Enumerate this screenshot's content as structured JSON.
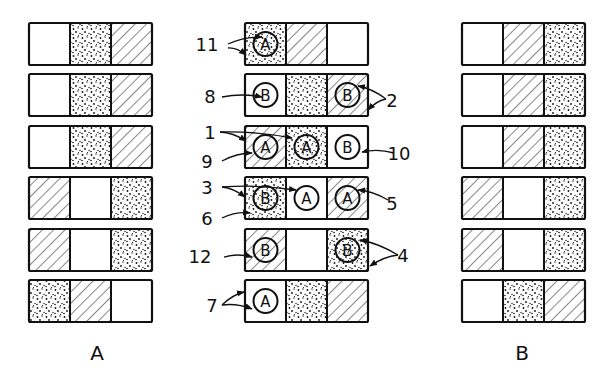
{
  "figure": {
    "column_labels": {
      "left": "A",
      "right": "B"
    },
    "legend_patterns": [
      "blank",
      "dotted",
      "hatched"
    ],
    "colors": {
      "ink": "#111111",
      "background": "#ffffff"
    }
  },
  "column_a": {
    "label": "A",
    "rows": [
      [
        "blank",
        "dotted",
        "hatched"
      ],
      [
        "blank",
        "dotted",
        "hatched"
      ],
      [
        "blank",
        "dotted",
        "hatched"
      ],
      [
        "hatched",
        "blank",
        "dotted"
      ],
      [
        "hatched",
        "blank",
        "dotted"
      ],
      [
        "dotted",
        "hatched",
        "blank"
      ]
    ]
  },
  "column_center": {
    "rows": [
      {
        "cells": [
          "dotted",
          "hatched",
          "blank"
        ],
        "circles": [
          {
            "cell": 0,
            "letter": "A"
          }
        ],
        "callouts": [
          {
            "num": "11",
            "side": "left"
          }
        ]
      },
      {
        "cells": [
          "blank",
          "dotted",
          "hatched"
        ],
        "circles": [
          {
            "cell": 0,
            "letter": "B"
          },
          {
            "cell": 2,
            "letter": "B"
          }
        ],
        "callouts": [
          {
            "num": "8",
            "side": "left"
          },
          {
            "num": "2",
            "side": "right"
          }
        ]
      },
      {
        "cells": [
          "hatched",
          "dotted",
          "blank"
        ],
        "circles": [
          {
            "cell": 0,
            "letter": "A"
          },
          {
            "cell": 1,
            "letter": "A"
          },
          {
            "cell": 2,
            "letter": "B"
          }
        ],
        "callouts": [
          {
            "num": "1",
            "side": "left"
          },
          {
            "num": "9",
            "side": "left"
          },
          {
            "num": "10",
            "side": "right"
          }
        ]
      },
      {
        "cells": [
          "dotted",
          "blank",
          "hatched"
        ],
        "circles": [
          {
            "cell": 0,
            "letter": "B"
          },
          {
            "cell": 1,
            "letter": "A"
          },
          {
            "cell": 2,
            "letter": "A"
          }
        ],
        "callouts": [
          {
            "num": "3",
            "side": "left"
          },
          {
            "num": "6",
            "side": "left"
          },
          {
            "num": "5",
            "side": "right"
          }
        ]
      },
      {
        "cells": [
          "hatched",
          "blank",
          "dotted"
        ],
        "circles": [
          {
            "cell": 0,
            "letter": "B"
          },
          {
            "cell": 2,
            "letter": "B"
          }
        ],
        "callouts": [
          {
            "num": "12",
            "side": "left"
          },
          {
            "num": "4",
            "side": "right"
          }
        ]
      },
      {
        "cells": [
          "blank",
          "dotted",
          "hatched"
        ],
        "circles": [
          {
            "cell": 0,
            "letter": "A"
          }
        ],
        "callouts": [
          {
            "num": "7",
            "side": "left"
          }
        ]
      }
    ]
  },
  "column_b": {
    "label": "B",
    "rows": [
      [
        "blank",
        "hatched",
        "dotted"
      ],
      [
        "blank",
        "hatched",
        "dotted"
      ],
      [
        "blank",
        "hatched",
        "dotted"
      ],
      [
        "hatched",
        "blank",
        "dotted"
      ],
      [
        "hatched",
        "blank",
        "dotted"
      ],
      [
        "blank",
        "dotted",
        "hatched"
      ]
    ]
  },
  "reference_numerals": [
    "1",
    "2",
    "3",
    "4",
    "5",
    "6",
    "7",
    "8",
    "9",
    "10",
    "11",
    "12"
  ]
}
